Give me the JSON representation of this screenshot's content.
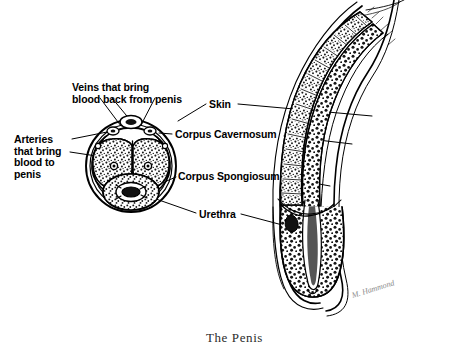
{
  "figure": {
    "caption": "The Penis",
    "signature": "M. Hammond",
    "background_color": "#ffffff",
    "ink_color": "#000000"
  },
  "labels": [
    {
      "id": "veins",
      "name": "label-veins",
      "text": "Veins that bring\nblood back from penis",
      "line1": "Veins that bring",
      "line2": "blood back from penis",
      "x": 72,
      "y": 82
    },
    {
      "id": "arteries",
      "name": "label-arteries",
      "text": "Arteries\nthat bring\nblood to\npenis",
      "line1": "Arteries",
      "line2": "that bring",
      "line3": "blood to",
      "line4": "penis",
      "x": 14,
      "y": 134
    },
    {
      "id": "skin",
      "name": "label-skin",
      "text": "Skin",
      "x": 209,
      "y": 99
    },
    {
      "id": "corpus-cavernosum",
      "name": "label-corpus-cavernosum",
      "text": "Corpus Cavernosum",
      "x": 175,
      "y": 129
    },
    {
      "id": "corpus-spongiosum",
      "name": "label-corpus-spongiosum",
      "text": "Corpus Spongiosum",
      "x": 178,
      "y": 171
    },
    {
      "id": "urethra",
      "name": "label-urethra",
      "text": "Urethra",
      "x": 199,
      "y": 209
    }
  ],
  "structures": {
    "cross_section": {
      "name": "penis-cross-section",
      "description": "Transverse cross-section of the penile shaft",
      "center_x": 131,
      "center_y": 165,
      "radius_x": 44,
      "radius_y": 47,
      "parts": [
        "corpus cavernosum left",
        "corpus cavernosum right",
        "corpus spongiosum",
        "urethra",
        "deep arteries",
        "dorsal vein",
        "tunica albuginea",
        "skin"
      ]
    },
    "longitudinal_section": {
      "name": "penis-longitudinal-section",
      "description": "Sagittal section of the penile shaft and glans",
      "parts": [
        "corpus cavernosum",
        "corpus spongiosum",
        "urethra",
        "glans penis",
        "skin"
      ]
    }
  }
}
